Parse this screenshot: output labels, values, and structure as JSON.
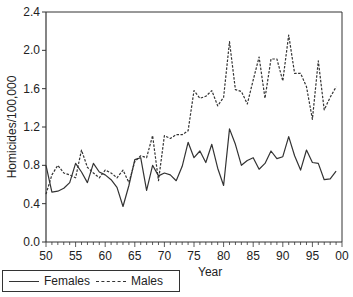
{
  "chart_data": {
    "type": "line",
    "title": "",
    "xlabel": "Year",
    "ylabel": "Homicides/100,000",
    "xlim": [
      1950,
      2000
    ],
    "ylim": [
      0.0,
      2.4
    ],
    "grid": false,
    "legend_position": "bottom-left",
    "x_tick_labels": [
      "50",
      "55",
      "60",
      "65",
      "70",
      "75",
      "80",
      "85",
      "90",
      "95",
      "00"
    ],
    "y_tick_labels": [
      "0.0",
      "0.4",
      "0.8",
      "1.2",
      "1.6",
      "2.0",
      "2.4"
    ],
    "x": [
      1950,
      1951,
      1952,
      1953,
      1954,
      1955,
      1956,
      1957,
      1958,
      1959,
      1960,
      1961,
      1962,
      1963,
      1964,
      1965,
      1966,
      1967,
      1968,
      1969,
      1970,
      1971,
      1972,
      1973,
      1974,
      1975,
      1976,
      1977,
      1978,
      1979,
      1980,
      1981,
      1982,
      1983,
      1984,
      1985,
      1986,
      1987,
      1988,
      1989,
      1990,
      1991,
      1992,
      1993,
      1994,
      1995,
      1996,
      1997,
      1998,
      1999
    ],
    "series": [
      {
        "name": "Females",
        "style": "solid",
        "color": "#333333",
        "values": [
          0.8,
          0.52,
          0.53,
          0.56,
          0.62,
          0.82,
          0.73,
          0.62,
          0.82,
          0.73,
          0.7,
          0.65,
          0.57,
          0.37,
          0.59,
          0.86,
          0.88,
          0.54,
          0.8,
          0.69,
          0.72,
          0.7,
          0.64,
          0.79,
          1.04,
          0.88,
          0.95,
          0.83,
          1.02,
          0.77,
          0.59,
          1.18,
          1.02,
          0.8,
          0.85,
          0.88,
          0.76,
          0.82,
          0.95,
          0.87,
          0.89,
          1.1,
          0.9,
          0.75,
          0.96,
          0.83,
          0.82,
          0.65,
          0.66,
          0.74
        ]
      },
      {
        "name": "Males",
        "style": "dashed",
        "color": "#333333",
        "values": [
          0.5,
          0.7,
          0.8,
          0.72,
          0.7,
          0.67,
          0.96,
          0.78,
          0.72,
          0.67,
          0.75,
          0.72,
          0.67,
          0.75,
          0.62,
          0.84,
          0.9,
          0.88,
          1.11,
          0.64,
          1.11,
          1.08,
          1.12,
          1.12,
          1.16,
          1.58,
          1.5,
          1.52,
          1.58,
          1.42,
          1.51,
          2.09,
          1.59,
          1.57,
          1.44,
          1.69,
          1.93,
          1.5,
          1.91,
          1.91,
          1.68,
          2.16,
          1.76,
          1.76,
          1.62,
          1.28,
          1.89,
          1.38,
          1.51,
          1.62
        ]
      }
    ]
  },
  "legend": {
    "females_label": "Females",
    "males_label": "Males"
  },
  "axes": {
    "xlabel": "Year",
    "ylabel": "Homicides/100,000"
  }
}
